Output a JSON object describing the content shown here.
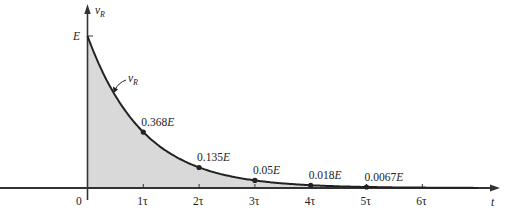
{
  "chart_data": {
    "type": "area",
    "title": "",
    "xlabel": "t",
    "ylabel": "vR",
    "ylabel_main": "v",
    "ylabel_sub": "R",
    "curve_label_main": "v",
    "curve_label_sub": "R",
    "y_max_label": "E",
    "origin_label": "0",
    "x_ticks": [
      "1τ",
      "2τ",
      "3τ",
      "4τ",
      "5τ",
      "6τ"
    ],
    "x_tick_values": [
      1,
      2,
      3,
      4,
      5,
      6
    ],
    "points": [
      {
        "x": 0,
        "y": 1.0
      },
      {
        "x": 1,
        "y": 0.368,
        "label_num": "0.368",
        "label_unit": "E"
      },
      {
        "x": 2,
        "y": 0.135,
        "label_num": "0.135",
        "label_unit": "E"
      },
      {
        "x": 3,
        "y": 0.05,
        "label_num": "0.05",
        "label_unit": "E"
      },
      {
        "x": 4,
        "y": 0.018,
        "label_num": "0.018",
        "label_unit": "E"
      },
      {
        "x": 5,
        "y": 0.0067,
        "label_num": "0.0067",
        "label_unit": "E"
      }
    ],
    "function": "vR = E·e^(-t/τ)",
    "xlim": [
      0,
      7
    ],
    "ylim": [
      0,
      1.0
    ],
    "grid": false,
    "fill_color": "#d9d9d9",
    "line_color": "#222222"
  }
}
